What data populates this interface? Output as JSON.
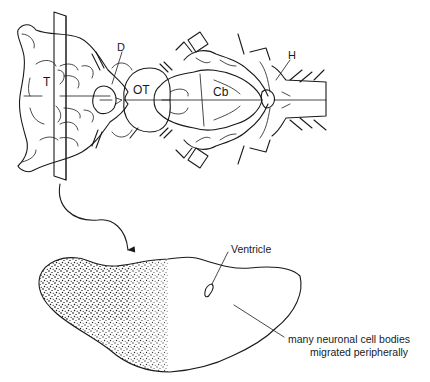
{
  "figure": {
    "dorsal_view": {
      "labels": {
        "telencephalon": "T",
        "diencephalon": "D",
        "optic_tectum": "OT",
        "cerebellum": "Cb",
        "hindbrain": "H"
      }
    },
    "cross_section": {
      "ventricle_label": "Ventricle",
      "annotation_line1": "many neuronal cell bodies",
      "annotation_line2": "migrated peripherally"
    },
    "colors": {
      "ink": "#1a1a1a",
      "background": "#ffffff"
    }
  }
}
